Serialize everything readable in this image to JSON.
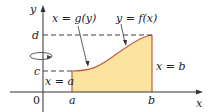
{
  "diagram": {
    "axes": {
      "x_label": "x",
      "y_label": "y",
      "origin_label": "0"
    },
    "x_ticks": [
      "a",
      "b"
    ],
    "y_ticks": [
      "c",
      "d"
    ],
    "curve_labels": {
      "g": "x = g(y)",
      "f": "y = f(x)"
    },
    "boundary_labels": {
      "left": "x = a",
      "right": "x = b"
    },
    "colors": {
      "fill": "#fbe3a0",
      "curve": "#c0603a",
      "axis": "#333333",
      "dash": "#444444"
    },
    "rotation_axis": "y-axis"
  }
}
